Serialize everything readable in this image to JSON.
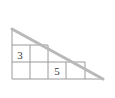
{
  "figure": {
    "kind": "geometry-diagram",
    "background_color": "#ffffff",
    "hypotenuse_color": "#b9b9b9",
    "grid_line_color": "#9a9a9a",
    "label_color": "#3a3a3a",
    "triangle": {
      "apex": {
        "x": 12,
        "y": 29
      },
      "right_angle": {
        "x": 12,
        "y": 79
      },
      "far_vertex": {
        "x": 103,
        "y": 79
      },
      "leg_vertical_length": 50,
      "leg_horizontal_length": 91
    },
    "grid": {
      "vertical_line_x": [
        12,
        30,
        48,
        66,
        85,
        103
      ],
      "horizontal_line_y": [
        79,
        62,
        45
      ],
      "cell_size": 18
    },
    "labels": [
      {
        "name": "label-3",
        "text": "3",
        "x": 20,
        "y": 55
      },
      {
        "name": "label-5",
        "text": "5",
        "x": 57,
        "y": 72
      }
    ]
  }
}
